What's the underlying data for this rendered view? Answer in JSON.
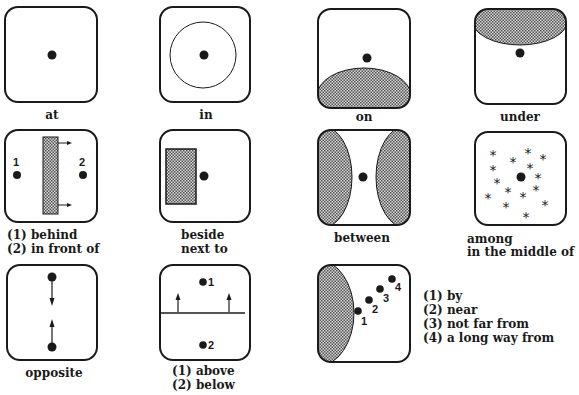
{
  "colors": {
    "ink": "#1a1a1a",
    "hatch_fill": "#9a9a9a",
    "background": "#ffffff"
  },
  "panels": [
    {
      "id": "at",
      "lines": [
        "at"
      ]
    },
    {
      "id": "in",
      "lines": [
        "in"
      ]
    },
    {
      "id": "on",
      "lines": [
        "on"
      ]
    },
    {
      "id": "under",
      "lines": [
        "under"
      ]
    },
    {
      "id": "behind-front",
      "lines": [
        "(1) behind",
        "(2) in front of"
      ],
      "markers": [
        "1",
        "2"
      ]
    },
    {
      "id": "beside",
      "lines": [
        "beside",
        "next to"
      ]
    },
    {
      "id": "between",
      "lines": [
        "between"
      ]
    },
    {
      "id": "among",
      "lines": [
        "among",
        "in the middle of"
      ]
    },
    {
      "id": "opposite",
      "lines": [
        "opposite"
      ]
    },
    {
      "id": "above-below",
      "lines": [
        "(1) above",
        "(2) below"
      ],
      "markers": [
        "1",
        "2"
      ]
    },
    {
      "id": "distance",
      "lines": [
        "(1) by",
        "(2) near",
        "(3) not far from",
        "(4) a long way from"
      ],
      "markers": [
        "1",
        "2",
        "3",
        "4"
      ]
    }
  ],
  "among_symbol": "*"
}
